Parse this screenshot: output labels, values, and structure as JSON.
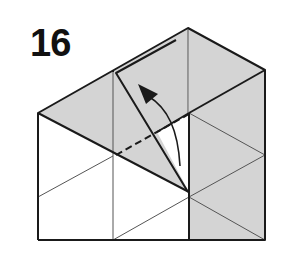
{
  "diagram": {
    "step_number": "16",
    "colors": {
      "paper_colored": "#d4d4d4",
      "paper_white": "#ffffff",
      "line": "#1a1a1a",
      "crease": "#555555"
    },
    "elements": [
      "origami model outline",
      "grey colored side faces",
      "white triangular faces with creases",
      "dashed valley fold line",
      "curved arrow indicating flap lifting up-left"
    ]
  }
}
